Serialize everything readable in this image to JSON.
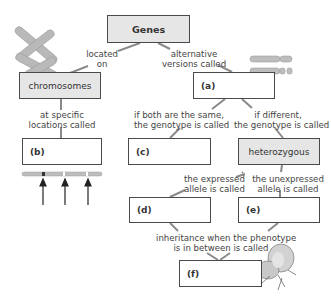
{
  "diagram": {
    "title_node": "Genes",
    "nodes": {
      "chromosomes": "chromosomes",
      "a": "(a)",
      "b": "(b)",
      "c": "(c)",
      "heterozygous": "heterozygous",
      "d": "(d)",
      "e": "(e)",
      "f": "(f)"
    },
    "edges": {
      "genes_to_chromosomes": [
        "located",
        "on"
      ],
      "genes_to_a": [
        "alternative",
        "versions called"
      ],
      "chromosomes_to_b": [
        "at specific",
        "locations called"
      ],
      "a_to_c": [
        "if both are the same,",
        "the genotype is called"
      ],
      "a_to_heterozygous": [
        "if different,",
        "the genotype is called"
      ],
      "heterozygous_to_d": [
        "the expressed",
        "allele is called"
      ],
      "heterozygous_to_e": [
        "the unexpressed",
        "allele is called"
      ],
      "de_to_f": [
        "inheritance when the phenotype",
        "is in between is called"
      ]
    },
    "colors": {
      "filled_box": "#e6e6e6",
      "border": "#4a4a4a",
      "connector": "#8a8a8a",
      "chromosome": "#b5b5b5"
    }
  }
}
